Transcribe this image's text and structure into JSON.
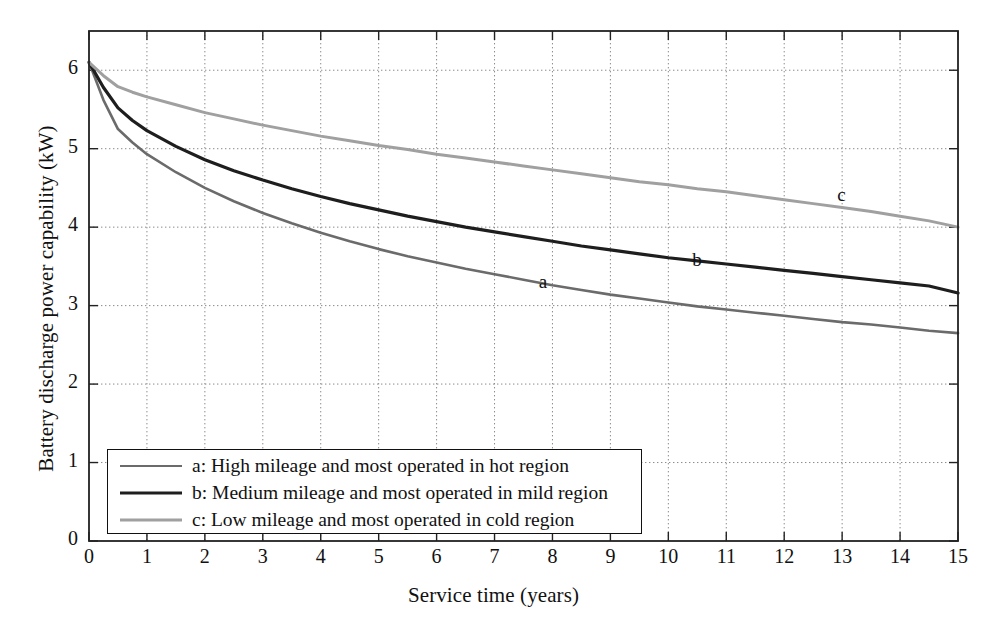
{
  "chart_data": {
    "type": "line",
    "title": "",
    "xlabel": "Service time (years)",
    "ylabel": "Battery discharge power capability (kW)",
    "xlim": [
      0,
      15
    ],
    "ylim": [
      0,
      6.5
    ],
    "xticks": [
      "0",
      "1",
      "2",
      "3",
      "4",
      "5",
      "6",
      "7",
      "8",
      "9",
      "10",
      "11",
      "12",
      "13",
      "14",
      "15"
    ],
    "yticks": [
      "0",
      "1",
      "2",
      "3",
      "4",
      "5",
      "6"
    ],
    "grid": true,
    "legend_position": "lower-left-inside",
    "x": [
      0,
      0.25,
      0.5,
      0.75,
      1,
      1.5,
      2,
      2.5,
      3,
      3.5,
      4,
      4.5,
      5,
      5.5,
      6,
      6.5,
      7,
      7.5,
      8,
      8.5,
      9,
      9.5,
      10,
      10.5,
      11,
      11.5,
      12,
      12.5,
      13,
      13.5,
      14,
      14.5,
      15
    ],
    "series": [
      {
        "name": "a",
        "label": "a: High mileage and most operated in hot region",
        "color": "#6b6b6b",
        "values": [
          6.1,
          5.62,
          5.25,
          5.08,
          4.93,
          4.7,
          4.5,
          4.33,
          4.18,
          4.05,
          3.93,
          3.82,
          3.72,
          3.63,
          3.55,
          3.47,
          3.4,
          3.33,
          3.26,
          3.2,
          3.14,
          3.09,
          3.04,
          2.99,
          2.95,
          2.91,
          2.87,
          2.83,
          2.79,
          2.76,
          2.72,
          2.68,
          2.65
        ]
      },
      {
        "name": "b",
        "label": "b: Medium mileage and most operated in mild region",
        "color": "#1e1e1e",
        "values": [
          6.1,
          5.78,
          5.52,
          5.36,
          5.23,
          5.03,
          4.86,
          4.72,
          4.6,
          4.49,
          4.39,
          4.3,
          4.22,
          4.14,
          4.07,
          4.0,
          3.94,
          3.88,
          3.82,
          3.76,
          3.71,
          3.66,
          3.61,
          3.57,
          3.53,
          3.49,
          3.45,
          3.41,
          3.37,
          3.33,
          3.29,
          3.25,
          3.16
        ]
      },
      {
        "name": "c",
        "label": "c: Low mileage and most operated in cold region",
        "color": "#a0a0a0",
        "values": [
          6.1,
          5.93,
          5.79,
          5.72,
          5.66,
          5.56,
          5.46,
          5.38,
          5.3,
          5.23,
          5.16,
          5.1,
          5.04,
          4.99,
          4.93,
          4.88,
          4.83,
          4.78,
          4.73,
          4.68,
          4.63,
          4.58,
          4.54,
          4.49,
          4.45,
          4.4,
          4.35,
          4.3,
          4.25,
          4.2,
          4.14,
          4.08,
          4.0
        ]
      }
    ],
    "annotations": [
      {
        "text": "a",
        "x": 7.85,
        "y": 3.28
      },
      {
        "text": "b",
        "x": 10.5,
        "y": 3.55
      },
      {
        "text": "c",
        "x": 13.0,
        "y": 4.38
      }
    ]
  },
  "legend": {
    "entries": [
      {
        "label": "a: High mileage and most operated in hot region",
        "color": "#6b6b6b",
        "weight": "2.6"
      },
      {
        "label": "b: Medium mileage and most operated in mild region",
        "color": "#1e1e1e",
        "weight": "3.2"
      },
      {
        "label": "c: Low mileage and most operated in cold region",
        "color": "#a0a0a0",
        "weight": "3.0"
      }
    ]
  },
  "colors": {
    "axis": "#222222",
    "grid": "#8a8a8a",
    "background": "#ffffff"
  }
}
